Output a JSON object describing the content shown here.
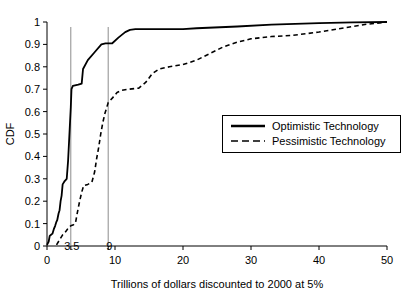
{
  "chart_data": {
    "type": "line",
    "title": "",
    "subtitle": "",
    "xlabel": "Trillions of dollars discounted to 2000 at 5%",
    "ylabel": "CDF",
    "xlim": [
      0,
      50
    ],
    "ylim": [
      0,
      1
    ],
    "xticks": [
      "0",
      "10",
      "20",
      "30",
      "40",
      "50"
    ],
    "xtick_values": [
      0,
      10,
      20,
      30,
      40,
      50
    ],
    "yticks": [
      "0",
      "0.1",
      "0.2",
      "0.3",
      "0.4",
      "0.5",
      "0.6",
      "0.7",
      "0.8",
      "0.9",
      "1"
    ],
    "ytick_values": [
      0,
      0.1,
      0.2,
      0.3,
      0.4,
      0.5,
      0.6,
      0.7,
      0.8,
      0.9,
      1
    ],
    "grid": false,
    "legend_position": "center-right",
    "annotations": [
      {
        "label": "3.5",
        "value": 3.5,
        "kind": "vertical-reference-line"
      },
      {
        "label": "9",
        "value": 9,
        "kind": "vertical-reference-line"
      }
    ],
    "series": [
      {
        "name": "Optimistic Technology",
        "style": "solid",
        "color": "#000000",
        "points": [
          [
            0.0,
            0.005
          ],
          [
            0.25,
            0.02
          ],
          [
            0.4,
            0.045
          ],
          [
            0.6,
            0.05
          ],
          [
            0.8,
            0.055
          ],
          [
            1.0,
            0.075
          ],
          [
            1.2,
            0.09
          ],
          [
            1.35,
            0.105
          ],
          [
            1.5,
            0.115
          ],
          [
            1.7,
            0.145
          ],
          [
            1.85,
            0.16
          ],
          [
            2.0,
            0.2
          ],
          [
            2.15,
            0.225
          ],
          [
            2.3,
            0.275
          ],
          [
            2.6,
            0.29
          ],
          [
            2.9,
            0.3
          ],
          [
            3.1,
            0.38
          ],
          [
            3.3,
            0.5
          ],
          [
            3.5,
            0.62
          ],
          [
            3.6,
            0.7
          ],
          [
            3.8,
            0.715
          ],
          [
            4.6,
            0.72
          ],
          [
            5.1,
            0.725
          ],
          [
            5.3,
            0.79
          ],
          [
            6.0,
            0.83
          ],
          [
            7.0,
            0.865
          ],
          [
            8.0,
            0.9
          ],
          [
            8.6,
            0.905
          ],
          [
            9.6,
            0.905
          ],
          [
            10.5,
            0.93
          ],
          [
            11.5,
            0.955
          ],
          [
            12.2,
            0.965
          ],
          [
            13.0,
            0.968
          ],
          [
            20.0,
            0.968
          ],
          [
            22.0,
            0.972
          ],
          [
            28.0,
            0.98
          ],
          [
            33.0,
            0.988
          ],
          [
            40.0,
            0.995
          ],
          [
            45.0,
            0.998
          ],
          [
            50.0,
            1.0
          ]
        ]
      },
      {
        "name": "Pessimistic Technology",
        "style": "dashed",
        "color": "#000000",
        "points": [
          [
            1.4,
            0.005
          ],
          [
            1.7,
            0.02
          ],
          [
            2.0,
            0.035
          ],
          [
            2.3,
            0.05
          ],
          [
            2.7,
            0.062
          ],
          [
            3.0,
            0.075
          ],
          [
            3.2,
            0.085
          ],
          [
            3.5,
            0.09
          ],
          [
            3.9,
            0.095
          ],
          [
            4.2,
            0.105
          ],
          [
            4.5,
            0.155
          ],
          [
            4.8,
            0.2
          ],
          [
            5.1,
            0.24
          ],
          [
            5.4,
            0.27
          ],
          [
            6.0,
            0.275
          ],
          [
            6.6,
            0.285
          ],
          [
            7.0,
            0.33
          ],
          [
            7.3,
            0.39
          ],
          [
            7.6,
            0.44
          ],
          [
            7.9,
            0.5
          ],
          [
            8.2,
            0.55
          ],
          [
            8.5,
            0.59
          ],
          [
            8.8,
            0.62
          ],
          [
            9.0,
            0.64
          ],
          [
            9.6,
            0.66
          ],
          [
            10.3,
            0.685
          ],
          [
            11.0,
            0.695
          ],
          [
            12.0,
            0.7
          ],
          [
            13.5,
            0.705
          ],
          [
            14.5,
            0.73
          ],
          [
            15.5,
            0.77
          ],
          [
            16.5,
            0.79
          ],
          [
            18.0,
            0.8
          ],
          [
            20.0,
            0.81
          ],
          [
            22.0,
            0.83
          ],
          [
            24.0,
            0.86
          ],
          [
            26.0,
            0.89
          ],
          [
            28.0,
            0.91
          ],
          [
            30.0,
            0.925
          ],
          [
            33.0,
            0.935
          ],
          [
            36.0,
            0.94
          ],
          [
            40.0,
            0.955
          ],
          [
            44.0,
            0.975
          ],
          [
            47.0,
            0.99
          ],
          [
            50.0,
            1.0
          ]
        ]
      }
    ]
  },
  "legend": {
    "items": [
      {
        "label": "Optimistic Technology",
        "style": "solid"
      },
      {
        "label": "Pessimistic Technology",
        "style": "dashed"
      }
    ]
  },
  "axes": {
    "y_title": "CDF",
    "x_title": "Trillions of dollars discounted to 2000 at 5%"
  },
  "annotations": {
    "ref_a": "3.5",
    "ref_b": "9"
  }
}
